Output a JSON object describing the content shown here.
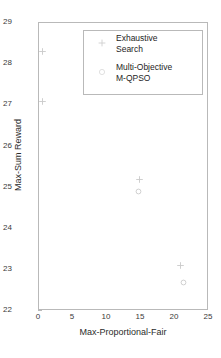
{
  "chart_data": {
    "type": "scatter",
    "title": "",
    "xlabel": "Max-Proportional-Fair",
    "ylabel": "Max-Sum Reward",
    "xlim": [
      0,
      25
    ],
    "ylim": [
      22,
      29
    ],
    "xticks": [
      "0",
      "5",
      "10",
      "15",
      "20",
      "25"
    ],
    "yticks": [
      "22",
      "23",
      "24",
      "25",
      "26",
      "27",
      "28",
      "29"
    ],
    "grid": false,
    "legend_position": "upper-center",
    "marker_color": "#c9c9c9",
    "series": [
      {
        "name": "Exhaustive\nSearch",
        "marker": "plus",
        "points": [
          {
            "x": 0.5,
            "y": 28.3
          },
          {
            "x": 0.5,
            "y": 27.1
          },
          {
            "x": 9.8,
            "y": 28.4
          },
          {
            "x": 14.8,
            "y": 25.2
          },
          {
            "x": 20.8,
            "y": 23.1
          }
        ]
      },
      {
        "name": "Multi-Objective\nM-QPSO",
        "marker": "circle",
        "points": [
          {
            "x": 14.7,
            "y": 24.9
          },
          {
            "x": 21.3,
            "y": 22.7
          }
        ]
      }
    ]
  },
  "legend": {
    "entry_0_label": "Exhaustive\nSearch",
    "entry_1_label": "Multi-Objective\nM-QPSO"
  },
  "axes": {
    "xlabel": "Max-Proportional-Fair",
    "ylabel": "Max-Sum Reward"
  }
}
